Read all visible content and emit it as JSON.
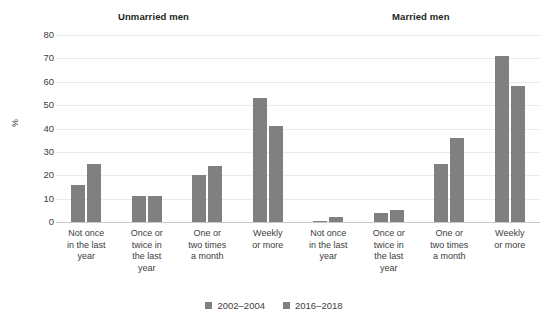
{
  "chart_data": {
    "type": "bar",
    "title": "",
    "xlabel": "",
    "ylabel": "%",
    "ylim": [
      0,
      80
    ],
    "yticks": [
      0,
      10,
      20,
      30,
      40,
      50,
      60,
      70,
      80
    ],
    "grid": true,
    "legend_position": "bottom-center",
    "panels": [
      {
        "name": "Unmarried men",
        "categories": [
          "Not once\nin the last\nyear",
          "Once or\ntwice in\nthe last\nyear",
          "One or\ntwo times\na month",
          "Weekly\nor more"
        ],
        "series": [
          {
            "name": "2002–2004",
            "values": [
              16,
              11,
              20,
              53
            ]
          },
          {
            "name": "2016–2018",
            "values": [
              25,
              11,
              24,
              41
            ]
          }
        ]
      },
      {
        "name": "Married men",
        "categories": [
          "Not once\nin the last\nyear",
          "Once or\ntwice in\nthe last\nyear",
          "One or\ntwo times\na month",
          "Weekly\nor more"
        ],
        "series": [
          {
            "name": "2002–2004",
            "values": [
              0.5,
              4,
              25,
              71
            ]
          },
          {
            "name": "2016–2018",
            "values": [
              2,
              5,
              36,
              58
            ]
          }
        ]
      }
    ],
    "legend": [
      "2002–2004",
      "2016–2018"
    ],
    "colors": {
      "series_2002_2004": "#808080",
      "series_2016_2018": "#808080",
      "gridline": "#e9e9e9"
    }
  },
  "ticks": {
    "t0": "0",
    "t10": "10",
    "t20": "20",
    "t30": "30",
    "t40": "40",
    "t50": "50",
    "t60": "60",
    "t70": "70",
    "t80": "80"
  },
  "panel_titles": {
    "unmarried": "Unmarried men",
    "married": "Married men"
  },
  "axis": {
    "y_label": "%"
  },
  "legend": {
    "item0": "2002–2004",
    "item1": "2016–2018"
  },
  "categories": {
    "c0": "Not once\nin the last\nyear",
    "c1": "Once or\ntwice in\nthe last\nyear",
    "c2": "One or\ntwo times\na month",
    "c3": "Weekly\nor more"
  }
}
